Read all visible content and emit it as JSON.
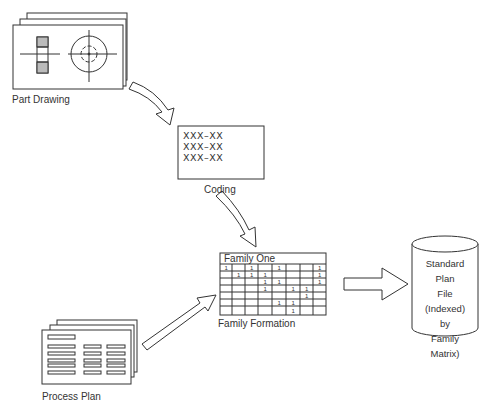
{
  "diagram": {
    "nodes": {
      "part_drawing": {
        "label": "Part Drawing"
      },
      "coding": {
        "label": "Coding",
        "lines": [
          "XXX–XX",
          "XXX–XX",
          "XXX–XX"
        ]
      },
      "family_formation": {
        "label": "Family Formation",
        "matrix_title": "Family One",
        "cells": [
          {
            "row": 0,
            "col": 0,
            "v": "1"
          },
          {
            "row": 0,
            "col": 2,
            "v": "1"
          },
          {
            "row": 0,
            "col": 4,
            "v": "1"
          },
          {
            "row": 0,
            "col": 7,
            "v": "1"
          },
          {
            "row": 1,
            "col": 1,
            "v": "1"
          },
          {
            "row": 1,
            "col": 2,
            "v": "1"
          },
          {
            "row": 1,
            "col": 3,
            "v": "1"
          },
          {
            "row": 1,
            "col": 7,
            "v": "1"
          },
          {
            "row": 2,
            "col": 3,
            "v": "1"
          },
          {
            "row": 2,
            "col": 4,
            "v": "1"
          },
          {
            "row": 2,
            "col": 7,
            "v": "1"
          },
          {
            "row": 3,
            "col": 3,
            "v": "1"
          },
          {
            "row": 3,
            "col": 5,
            "v": "1"
          },
          {
            "row": 3,
            "col": 6,
            "v": "1"
          },
          {
            "row": 4,
            "col": 6,
            "v": "1"
          },
          {
            "row": 5,
            "col": 4,
            "v": "1"
          },
          {
            "row": 5,
            "col": 5,
            "v": "1"
          },
          {
            "row": 6,
            "col": 5,
            "v": "1"
          }
        ]
      },
      "process_plan": {
        "label": "Process Plan"
      },
      "standard_plan_file": {
        "lines": [
          "Standard",
          "Plan",
          "File",
          "(Indexed)",
          "by",
          "Family",
          "Matrix)"
        ]
      }
    },
    "edges": [
      {
        "from": "part_drawing",
        "to": "coding"
      },
      {
        "from": "coding",
        "to": "family_formation"
      },
      {
        "from": "process_plan",
        "to": "family_formation"
      },
      {
        "from": "family_formation",
        "to": "standard_plan_file"
      }
    ]
  }
}
